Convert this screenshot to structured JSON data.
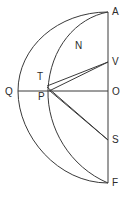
{
  "figure": {
    "background_color": "#ffffff",
    "stroke_color": "#3a3a3a",
    "label_color": "#2b2b2b",
    "width": 130,
    "height": 197
  },
  "labels": {
    "A": "A",
    "N": "N",
    "V": "V",
    "T": "T",
    "Q": "Q",
    "P": "P",
    "O": "O",
    "S": "S",
    "F": "F"
  },
  "label_positions": {
    "A": {
      "x": 112,
      "y": 7
    },
    "N": {
      "x": 75,
      "y": 41
    },
    "V": {
      "x": 112,
      "y": 57
    },
    "T": {
      "x": 37,
      "y": 72
    },
    "Q": {
      "x": 5,
      "y": 87
    },
    "P": {
      "x": 38,
      "y": 92
    },
    "O": {
      "x": 112,
      "y": 87
    },
    "S": {
      "x": 112,
      "y": 135
    },
    "F": {
      "x": 112,
      "y": 178
    }
  },
  "points": {
    "A": {
      "x": 108,
      "y": 12
    },
    "V": {
      "x": 108,
      "y": 62
    },
    "O": {
      "x": 108,
      "y": 91
    },
    "S": {
      "x": 108,
      "y": 140
    },
    "F": {
      "x": 108,
      "y": 183
    },
    "Q": {
      "x": 18,
      "y": 91
    },
    "T": {
      "x": 47,
      "y": 86
    },
    "P": {
      "x": 49,
      "y": 90
    }
  },
  "elements": {
    "axis_vertical": "Vertical chord A-V-O-S-F on the right",
    "axis_horizontal": "Horizontal diameter Q-P-O",
    "arc_outer": "Outer arc A-Q-F",
    "arc_inner": "Arc A-N-T/P-F",
    "segment_T_V": "Segment from T to V",
    "segment_P_V": "Segment from P to V",
    "segment_T_S": "Segment from T to S",
    "segment_P_S": "Segment from P to S"
  }
}
